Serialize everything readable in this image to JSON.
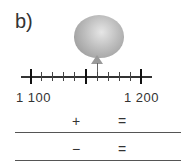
{
  "exercise": {
    "label": "b)",
    "number_line": {
      "start_label": "1 100",
      "end_label": "1 200",
      "start_value": 1100,
      "end_value": 1200,
      "minor_step": 10,
      "ticks": [
        0,
        1,
        2,
        3,
        4,
        5,
        6,
        7,
        8,
        9,
        10
      ],
      "balloon_position_tick": 6
    },
    "equations": [
      {
        "operator": "+",
        "equals": "="
      },
      {
        "operator": "−",
        "equals": "="
      }
    ]
  }
}
